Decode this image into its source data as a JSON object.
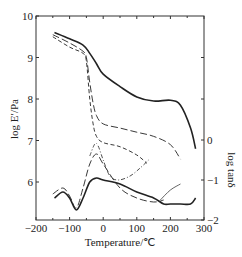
{
  "chart_data": {
    "type": "line",
    "title": "",
    "xlabel": "Temperature/℃",
    "ylabel": "log E′/Pa",
    "y2label": "log tanδ",
    "xlim": [
      -200,
      300
    ],
    "ylim": [
      5.05,
      10
    ],
    "y2lim": [
      -2.0,
      0.0
    ],
    "xticks": [
      -200,
      -100,
      0,
      100,
      200,
      300
    ],
    "yticks": [
      6,
      7,
      8,
      9,
      10
    ],
    "y2ticks": [
      0,
      -1,
      -2
    ],
    "grid": false,
    "legend": "none",
    "series": [
      {
        "name": "log E' (solid)",
        "axis": "left",
        "style": "solid",
        "x": [
          -145,
          -100,
          -60,
          -40,
          -20,
          0,
          50,
          100,
          150,
          200,
          230,
          260,
          275
        ],
        "y": [
          9.6,
          9.45,
          9.3,
          9.1,
          8.85,
          8.6,
          8.3,
          8.05,
          7.95,
          7.97,
          7.85,
          7.3,
          6.8
        ]
      },
      {
        "name": "log E' (long dash)",
        "axis": "left",
        "style": "long-dash",
        "x": [
          -150,
          -100,
          -60,
          -50,
          -40,
          -30,
          -20,
          0,
          50,
          100,
          150,
          200,
          230
        ],
        "y": [
          9.55,
          9.35,
          9.15,
          9.0,
          8.4,
          7.9,
          7.6,
          7.4,
          7.3,
          7.2,
          7.1,
          6.9,
          6.55
        ]
      },
      {
        "name": "log E' (short dash)",
        "axis": "left",
        "style": "short-dash",
        "x": [
          -150,
          -100,
          -60,
          -50,
          -40,
          -30,
          -20,
          0,
          50,
          100,
          130
        ],
        "y": [
          9.5,
          9.25,
          9.1,
          8.9,
          8.0,
          7.4,
          7.1,
          6.95,
          6.85,
          6.65,
          6.45
        ]
      },
      {
        "name": "log tanδ (solid)",
        "axis": "right",
        "style": "solid",
        "x": [
          -145,
          -120,
          -100,
          -80,
          -60,
          -40,
          -20,
          0,
          50,
          100,
          150,
          180,
          200,
          230,
          260,
          275
        ],
        "y": [
          -1.45,
          -1.3,
          -1.45,
          -1.75,
          -1.45,
          -1.05,
          -0.95,
          -1.0,
          -1.1,
          -1.3,
          -1.45,
          -1.6,
          -1.6,
          -1.6,
          -1.6,
          -1.45
        ]
      },
      {
        "name": "log tanδ (long dash)",
        "axis": "right",
        "style": "long-dash",
        "x": [
          -150,
          -120,
          -100,
          -80,
          -60,
          -40,
          -20,
          0,
          50,
          100,
          150,
          180
        ],
        "y": [
          -1.35,
          -1.2,
          -1.4,
          -1.7,
          -1.2,
          -0.6,
          -0.35,
          -0.6,
          -1.2,
          -1.45,
          -1.55,
          -1.5
        ]
      },
      {
        "name": "log tanδ (dash-dot)",
        "axis": "right",
        "style": "dash-dot",
        "x": [
          -40,
          -25,
          -15,
          0,
          20,
          45,
          80,
          110,
          135
        ],
        "y": [
          -0.4,
          -0.1,
          -0.15,
          -0.5,
          -0.9,
          -1.0,
          -0.9,
          -0.7,
          -0.5
        ]
      },
      {
        "name": "log tanδ (thin)",
        "axis": "right",
        "style": "thin-solid",
        "x": [
          170,
          200,
          230
        ],
        "y": [
          -1.5,
          -1.25,
          -1.1
        ]
      }
    ]
  }
}
